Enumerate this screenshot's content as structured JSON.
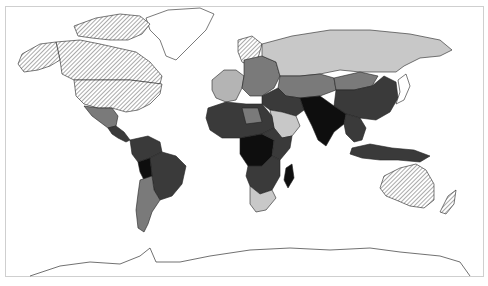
{
  "map": {
    "title": "",
    "type": "choropleth-world",
    "legend_visible": false,
    "fill_classes": {
      "hatched": {
        "color": "#ffffff",
        "pattern": "diagonal-hatch"
      },
      "none": {
        "color": "#ffffff"
      },
      "very-light": {
        "color": "#c8c8c8"
      },
      "light": {
        "color": "#b4b4b4"
      },
      "medium": {
        "color": "#7a7a7a"
      },
      "medium-dark": {
        "color": "#5a5a5a"
      },
      "dark": {
        "color": "#3a3a3a"
      },
      "darkest": {
        "color": "#0e0e0e"
      }
    },
    "regions": [
      {
        "name": "canada",
        "class": "hatched"
      },
      {
        "name": "alaska",
        "class": "hatched"
      },
      {
        "name": "usa",
        "class": "hatched"
      },
      {
        "name": "greenland",
        "class": "none"
      },
      {
        "name": "canadian-arctic-islands",
        "class": "hatched"
      },
      {
        "name": "mexico",
        "class": "medium"
      },
      {
        "name": "central-america",
        "class": "dark"
      },
      {
        "name": "northern-south-america",
        "class": "dark"
      },
      {
        "name": "brazil",
        "class": "dark"
      },
      {
        "name": "bolivia",
        "class": "darkest"
      },
      {
        "name": "argentina-chile",
        "class": "medium"
      },
      {
        "name": "western-europe",
        "class": "light"
      },
      {
        "name": "scandinavia",
        "class": "hatched"
      },
      {
        "name": "eastern-europe",
        "class": "medium"
      },
      {
        "name": "russia",
        "class": "very-light"
      },
      {
        "name": "central-asia",
        "class": "medium"
      },
      {
        "name": "mongolia",
        "class": "medium"
      },
      {
        "name": "china",
        "class": "dark"
      },
      {
        "name": "middle-east",
        "class": "dark"
      },
      {
        "name": "arabian-peninsula",
        "class": "very-light"
      },
      {
        "name": "south-asia",
        "class": "darkest"
      },
      {
        "name": "southeast-asia",
        "class": "dark"
      },
      {
        "name": "north-africa",
        "class": "dark"
      },
      {
        "name": "libya",
        "class": "medium"
      },
      {
        "name": "central-africa",
        "class": "darkest"
      },
      {
        "name": "east-africa",
        "class": "dark"
      },
      {
        "name": "southern-africa",
        "class": "dark"
      },
      {
        "name": "south-africa",
        "class": "very-light"
      },
      {
        "name": "madagascar",
        "class": "darkest"
      },
      {
        "name": "indonesia",
        "class": "dark"
      },
      {
        "name": "japan",
        "class": "none"
      },
      {
        "name": "australia",
        "class": "hatched"
      },
      {
        "name": "new-zealand",
        "class": "hatched"
      },
      {
        "name": "antarctica",
        "class": "none"
      }
    ]
  }
}
